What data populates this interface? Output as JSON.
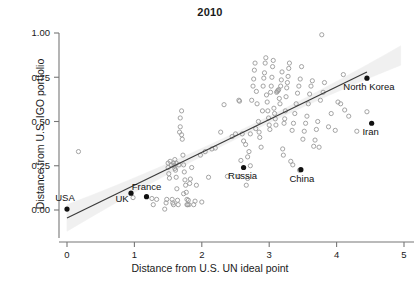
{
  "chart_data": {
    "type": "scatter",
    "title": "2010",
    "xlabel": "Distance from U.S. UN ideal point",
    "ylabel": "Distance from U.S. IGO portfolio",
    "xlim": [
      0,
      5
    ],
    "ylim": [
      -0.12,
      1.05
    ],
    "xticks": [
      0,
      1,
      2,
      3,
      4,
      5
    ],
    "xticklabels": [
      "0",
      "1",
      "2",
      "3",
      "4",
      "5"
    ],
    "yticks": [
      0.0,
      0.25,
      0.5,
      0.75,
      1.0
    ],
    "yticklabels": [
      "0.00",
      "0.25",
      "0.50",
      "0.75",
      "1.00"
    ],
    "grid": false,
    "legend": "none",
    "colors": {
      "open_point_stroke": "#9a9a9a",
      "highlight_point": "#111111",
      "regression_line": "#3a3a3a",
      "confidence_band": "#f0f0f0",
      "axis": "#777777",
      "text": "#1a1a1a"
    },
    "regression": {
      "description": "linear fit with confidence band",
      "x_start": 0.0,
      "y_start": -0.045,
      "x_end": 4.45,
      "y_end": 0.78,
      "slope": 0.1854,
      "intercept": -0.045,
      "band_half_width_at_x0": 0.075,
      "band_half_width_at_mid": 0.018,
      "band_half_width_at_xmax": 0.055
    },
    "highlighted": [
      {
        "name": "USA",
        "x": 0.0,
        "y": 0.005,
        "label_dx": -2,
        "label_dy": -8,
        "anchor": "middle"
      },
      {
        "name": "UK",
        "x": 0.95,
        "y": 0.095,
        "label_dx": -9,
        "label_dy": 9,
        "anchor": "middle"
      },
      {
        "name": "France",
        "x": 1.18,
        "y": 0.075,
        "label_dx": 0,
        "label_dy": -7,
        "anchor": "middle"
      },
      {
        "name": "Russia",
        "x": 2.62,
        "y": 0.24,
        "label_dx": -1,
        "label_dy": 11,
        "anchor": "middle"
      },
      {
        "name": "China",
        "x": 3.47,
        "y": 0.228,
        "label_dx": 1,
        "label_dy": 12,
        "anchor": "middle"
      },
      {
        "name": "North Korea",
        "x": 4.45,
        "y": 0.745,
        "label_dx": 2,
        "label_dy": 12,
        "anchor": "middle"
      },
      {
        "name": "Iran",
        "x": 4.52,
        "y": 0.49,
        "label_dx": -1,
        "label_dy": 12,
        "anchor": "middle"
      }
    ],
    "points": [
      [
        0.17,
        0.33
      ],
      [
        0.98,
        0.07
      ],
      [
        1.26,
        0.065
      ],
      [
        1.28,
        0.03
      ],
      [
        1.45,
        0.005
      ],
      [
        1.47,
        0.04
      ],
      [
        1.48,
        0.06
      ],
      [
        1.5,
        0.265
      ],
      [
        1.5,
        0.24
      ],
      [
        1.51,
        0.205
      ],
      [
        1.52,
        0.18
      ],
      [
        1.53,
        0.275
      ],
      [
        1.55,
        0.255
      ],
      [
        1.56,
        0.06
      ],
      [
        1.57,
        0.04
      ],
      [
        1.58,
        0.03
      ],
      [
        1.58,
        0.265
      ],
      [
        1.59,
        0.25
      ],
      [
        1.6,
        0.235
      ],
      [
        1.6,
        0.285
      ],
      [
        1.61,
        0.225
      ],
      [
        1.62,
        0.265
      ],
      [
        1.62,
        0.185
      ],
      [
        1.63,
        0.12
      ],
      [
        1.64,
        0.055
      ],
      [
        1.65,
        0.03
      ],
      [
        1.66,
        0.255
      ],
      [
        1.67,
        0.44
      ],
      [
        1.68,
        0.52
      ],
      [
        1.68,
        0.47
      ],
      [
        1.7,
        0.56
      ],
      [
        1.7,
        0.425
      ],
      [
        1.71,
        0.4
      ],
      [
        1.72,
        0.31
      ],
      [
        1.73,
        0.255
      ],
      [
        1.74,
        0.215
      ],
      [
        1.75,
        0.17
      ],
      [
        1.76,
        0.14
      ],
      [
        1.77,
        0.1
      ],
      [
        1.78,
        0.06
      ],
      [
        1.78,
        0.03
      ],
      [
        1.79,
        0.03
      ],
      [
        1.8,
        0.055
      ],
      [
        1.81,
        0.03
      ],
      [
        1.82,
        0.15
      ],
      [
        1.83,
        0.175
      ],
      [
        1.85,
        0.24
      ],
      [
        1.88,
        0.03
      ],
      [
        1.9,
        0.05
      ],
      [
        1.92,
        0.14
      ],
      [
        1.98,
        0.31
      ],
      [
        2.0,
        0.045
      ],
      [
        2.05,
        0.33
      ],
      [
        2.1,
        0.185
      ],
      [
        2.15,
        0.345
      ],
      [
        2.2,
        0.35
      ],
      [
        2.28,
        0.44
      ],
      [
        2.33,
        0.595
      ],
      [
        2.38,
        0.19
      ],
      [
        2.45,
        0.415
      ],
      [
        2.5,
        0.43
      ],
      [
        2.55,
        0.62
      ],
      [
        2.56,
        0.615
      ],
      [
        2.58,
        0.28
      ],
      [
        2.6,
        0.43
      ],
      [
        2.62,
        0.39
      ],
      [
        2.65,
        0.37
      ],
      [
        2.66,
        0.14
      ],
      [
        2.68,
        0.3
      ],
      [
        2.7,
        0.33
      ],
      [
        2.72,
        0.43
      ],
      [
        2.74,
        0.62
      ],
      [
        2.76,
        0.7
      ],
      [
        2.77,
        0.74
      ],
      [
        2.78,
        0.79
      ],
      [
        2.79,
        0.83
      ],
      [
        2.8,
        0.46
      ],
      [
        2.81,
        0.67
      ],
      [
        2.82,
        0.6
      ],
      [
        2.84,
        0.5
      ],
      [
        2.85,
        0.44
      ],
      [
        2.86,
        0.41
      ],
      [
        2.88,
        0.355
      ],
      [
        2.9,
        0.56
      ],
      [
        2.91,
        0.7
      ],
      [
        2.92,
        0.745
      ],
      [
        2.93,
        0.775
      ],
      [
        2.94,
        0.83
      ],
      [
        2.95,
        0.86
      ],
      [
        2.96,
        0.65
      ],
      [
        2.97,
        0.61
      ],
      [
        2.98,
        0.56
      ],
      [
        2.99,
        0.52
      ],
      [
        3.0,
        0.48
      ],
      [
        3.01,
        0.455
      ],
      [
        3.02,
        0.665
      ],
      [
        3.03,
        0.7
      ],
      [
        3.04,
        0.75
      ],
      [
        3.05,
        0.81
      ],
      [
        3.06,
        0.845
      ],
      [
        3.07,
        0.575
      ],
      [
        3.08,
        0.545
      ],
      [
        3.09,
        0.515
      ],
      [
        3.1,
        0.48
      ],
      [
        3.11,
        0.665
      ],
      [
        3.12,
        0.67
      ],
      [
        3.13,
        0.675
      ],
      [
        3.14,
        0.68
      ],
      [
        3.15,
        0.63
      ],
      [
        3.16,
        0.6
      ],
      [
        3.17,
        0.7
      ],
      [
        3.18,
        0.735
      ],
      [
        3.19,
        0.78
      ],
      [
        3.2,
        0.345
      ],
      [
        3.21,
        0.31
      ],
      [
        3.22,
        0.49
      ],
      [
        3.23,
        0.515
      ],
      [
        3.24,
        0.56
      ],
      [
        3.25,
        0.64
      ],
      [
        3.26,
        0.69
      ],
      [
        3.27,
        0.72
      ],
      [
        3.28,
        0.755
      ],
      [
        3.29,
        0.8
      ],
      [
        3.3,
        0.83
      ],
      [
        3.32,
        0.275
      ],
      [
        3.34,
        0.45
      ],
      [
        3.36,
        0.49
      ],
      [
        3.38,
        0.545
      ],
      [
        3.4,
        0.6
      ],
      [
        3.42,
        0.66
      ],
      [
        3.44,
        0.7
      ],
      [
        3.46,
        0.74
      ],
      [
        3.48,
        0.81
      ],
      [
        3.5,
        0.4
      ],
      [
        3.52,
        0.445
      ],
      [
        3.54,
        0.49
      ],
      [
        3.56,
        0.53
      ],
      [
        3.58,
        0.6
      ],
      [
        3.6,
        0.655
      ],
      [
        3.62,
        0.7
      ],
      [
        3.64,
        0.73
      ],
      [
        3.66,
        0.36
      ],
      [
        3.68,
        0.395
      ],
      [
        3.7,
        0.455
      ],
      [
        3.72,
        0.5
      ],
      [
        3.74,
        0.355
      ],
      [
        3.76,
        0.62
      ],
      [
        3.78,
        0.99
      ],
      [
        3.8,
        0.665
      ],
      [
        3.82,
        0.72
      ],
      [
        3.88,
        0.47
      ],
      [
        3.92,
        0.545
      ],
      [
        3.98,
        0.45
      ],
      [
        4.02,
        0.61
      ],
      [
        4.06,
        0.6
      ],
      [
        4.1,
        0.765
      ],
      [
        4.12,
        0.565
      ],
      [
        4.18,
        0.53
      ],
      [
        4.3,
        0.445
      ],
      [
        4.45,
        0.555
      ],
      [
        3.45,
        0.225
      ],
      [
        2.72,
        0.25
      ],
      [
        2.68,
        0.178
      ],
      [
        3.35,
        0.255
      ],
      [
        2.55,
        0.19
      ],
      [
        1.73,
        0.092
      ],
      [
        1.33,
        0.06
      ]
    ]
  }
}
